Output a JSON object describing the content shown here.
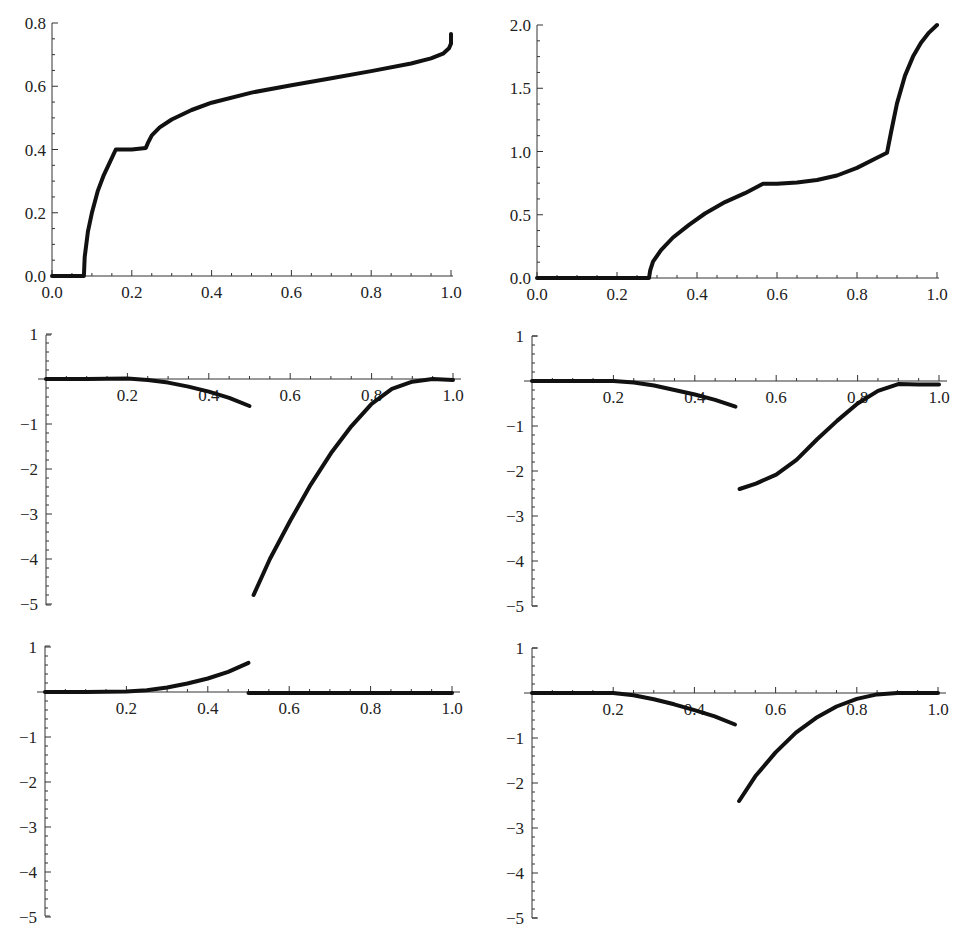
{
  "chart_data": [
    {
      "id": "panel-top-left",
      "type": "line",
      "title": "",
      "xlabel": "",
      "ylabel": "",
      "xlim": [
        0,
        1
      ],
      "ylim": [
        0,
        0.8
      ],
      "grid": false,
      "x_ticks": [
        "0.0",
        "0.2",
        "0.4",
        "0.6",
        "0.8",
        "1.0"
      ],
      "y_ticks": [
        "0.0",
        "0.2",
        "0.4",
        "0.6",
        "0.8"
      ],
      "frame": {
        "x0": 52,
        "x1": 451,
        "y0": 276,
        "ytop": 23,
        "axis_mode": "frame"
      },
      "series": [
        {
          "name": "curve",
          "points": [
            [
              0,
              0
            ],
            [
              0.08,
              0
            ],
            [
              0.082,
              0.06
            ],
            [
              0.09,
              0.14
            ],
            [
              0.1,
              0.2
            ],
            [
              0.115,
              0.27
            ],
            [
              0.13,
              0.32
            ],
            [
              0.145,
              0.36
            ],
            [
              0.16,
              0.4
            ],
            [
              0.2,
              0.4
            ],
            [
              0.235,
              0.405
            ],
            [
              0.24,
              0.42
            ],
            [
              0.25,
              0.445
            ],
            [
              0.27,
              0.47
            ],
            [
              0.3,
              0.495
            ],
            [
              0.35,
              0.525
            ],
            [
              0.4,
              0.548
            ],
            [
              0.5,
              0.58
            ],
            [
              0.6,
              0.603
            ],
            [
              0.7,
              0.625
            ],
            [
              0.8,
              0.648
            ],
            [
              0.9,
              0.672
            ],
            [
              0.95,
              0.688
            ],
            [
              0.98,
              0.703
            ],
            [
              0.995,
              0.72
            ],
            [
              1.0,
              0.735
            ],
            [
              1.0,
              0.765
            ]
          ]
        }
      ]
    },
    {
      "id": "panel-top-right",
      "type": "line",
      "title": "",
      "xlabel": "",
      "ylabel": "",
      "xlim": [
        0,
        1
      ],
      "ylim": [
        0,
        2.0
      ],
      "grid": false,
      "x_ticks": [
        "0.0",
        "0.2",
        "0.4",
        "0.6",
        "0.8",
        "1.0"
      ],
      "y_ticks": [
        "0.0",
        "0.5",
        "1.0",
        "1.5",
        "2.0"
      ],
      "frame": {
        "x0": 537,
        "x1": 937,
        "y0": 278,
        "ytop": 25,
        "axis_mode": "frame"
      },
      "series": [
        {
          "name": "curve",
          "points": [
            [
              0,
              0
            ],
            [
              0.28,
              0
            ],
            [
              0.283,
              0.06
            ],
            [
              0.29,
              0.13
            ],
            [
              0.31,
              0.22
            ],
            [
              0.34,
              0.32
            ],
            [
              0.38,
              0.42
            ],
            [
              0.42,
              0.51
            ],
            [
              0.47,
              0.6
            ],
            [
              0.52,
              0.67
            ],
            [
              0.565,
              0.745
            ],
            [
              0.6,
              0.745
            ],
            [
              0.65,
              0.755
            ],
            [
              0.7,
              0.775
            ],
            [
              0.75,
              0.81
            ],
            [
              0.8,
              0.87
            ],
            [
              0.85,
              0.95
            ],
            [
              0.875,
              0.99
            ],
            [
              0.885,
              1.15
            ],
            [
              0.9,
              1.38
            ],
            [
              0.92,
              1.6
            ],
            [
              0.94,
              1.75
            ],
            [
              0.96,
              1.86
            ],
            [
              0.98,
              1.94
            ],
            [
              1.0,
              2.0
            ]
          ]
        }
      ]
    },
    {
      "id": "panel-middle-left",
      "type": "line",
      "title": "",
      "xlabel": "",
      "ylabel": "",
      "xlim": [
        0,
        1
      ],
      "ylim": [
        -5,
        1
      ],
      "grid": false,
      "x_ticks": [
        "0.2",
        "0.4",
        "0.6",
        "0.8",
        "1.0"
      ],
      "y_ticks": [
        "1",
        "-1",
        "-2",
        "-3",
        "-4",
        "-5"
      ],
      "frame": {
        "x0": 46,
        "x1": 453,
        "y1": 335,
        "y0": 379,
        "ybot": 605,
        "axis_mode": "origin"
      },
      "series": [
        {
          "name": "segment-1",
          "points": [
            [
              0,
              0
            ],
            [
              0.1,
              0
            ],
            [
              0.2,
              0.01
            ],
            [
              0.25,
              -0.02
            ],
            [
              0.3,
              -0.08
            ],
            [
              0.35,
              -0.17
            ],
            [
              0.4,
              -0.28
            ],
            [
              0.45,
              -0.42
            ],
            [
              0.5,
              -0.6
            ]
          ]
        },
        {
          "name": "segment-2",
          "points": [
            [
              0.51,
              -4.8
            ],
            [
              0.55,
              -4.0
            ],
            [
              0.6,
              -3.15
            ],
            [
              0.65,
              -2.35
            ],
            [
              0.7,
              -1.65
            ],
            [
              0.75,
              -1.05
            ],
            [
              0.8,
              -0.55
            ],
            [
              0.85,
              -0.22
            ],
            [
              0.9,
              -0.06
            ],
            [
              0.95,
              0
            ],
            [
              1.0,
              -0.02
            ]
          ]
        }
      ]
    },
    {
      "id": "panel-middle-right",
      "type": "line",
      "title": "",
      "xlabel": "",
      "ylabel": "",
      "xlim": [
        0,
        1
      ],
      "ylim": [
        -5,
        1
      ],
      "grid": false,
      "x_ticks": [
        "0.2",
        "0.4",
        "0.6",
        "0.8",
        "1.0"
      ],
      "y_ticks": [
        "1",
        "-1",
        "-2",
        "-3",
        "-4",
        "-5"
      ],
      "frame": {
        "x0": 532,
        "x1": 939,
        "y1": 336,
        "y0": 381,
        "ybot": 606,
        "axis_mode": "origin"
      },
      "series": [
        {
          "name": "segment-1",
          "points": [
            [
              0,
              0
            ],
            [
              0.1,
              0
            ],
            [
              0.2,
              0
            ],
            [
              0.25,
              -0.03
            ],
            [
              0.3,
              -0.1
            ],
            [
              0.35,
              -0.2
            ],
            [
              0.4,
              -0.3
            ],
            [
              0.45,
              -0.42
            ],
            [
              0.5,
              -0.57
            ]
          ]
        },
        {
          "name": "segment-2",
          "points": [
            [
              0.51,
              -2.4
            ],
            [
              0.55,
              -2.28
            ],
            [
              0.6,
              -2.08
            ],
            [
              0.65,
              -1.75
            ],
            [
              0.7,
              -1.3
            ],
            [
              0.75,
              -0.88
            ],
            [
              0.8,
              -0.5
            ],
            [
              0.85,
              -0.22
            ],
            [
              0.9,
              -0.07
            ],
            [
              0.95,
              -0.08
            ],
            [
              1.0,
              -0.08
            ]
          ]
        }
      ]
    },
    {
      "id": "panel-bottom-left",
      "type": "line",
      "title": "",
      "xlabel": "",
      "ylabel": "",
      "xlim": [
        0,
        1
      ],
      "ylim": [
        -5,
        1
      ],
      "grid": false,
      "x_ticks": [
        "0.2",
        "0.4",
        "0.6",
        "0.8",
        "1.0"
      ],
      "y_ticks": [
        "1",
        "-1",
        "-2",
        "-3",
        "-4",
        "-5"
      ],
      "frame": {
        "x0": 45,
        "x1": 452,
        "y1": 646,
        "y0": 692,
        "ybot": 916,
        "axis_mode": "origin"
      },
      "series": [
        {
          "name": "segment-1",
          "points": [
            [
              0,
              0
            ],
            [
              0.1,
              0
            ],
            [
              0.2,
              0.01
            ],
            [
              0.25,
              0.04
            ],
            [
              0.3,
              0.1
            ],
            [
              0.35,
              0.19
            ],
            [
              0.4,
              0.3
            ],
            [
              0.45,
              0.45
            ],
            [
              0.5,
              0.65
            ]
          ]
        },
        {
          "name": "segment-2",
          "points": [
            [
              0.5,
              -0.02
            ],
            [
              0.6,
              -0.02
            ],
            [
              0.7,
              -0.02
            ],
            [
              0.8,
              -0.02
            ],
            [
              0.9,
              -0.02
            ],
            [
              1.0,
              -0.02
            ]
          ]
        }
      ]
    },
    {
      "id": "panel-bottom-right",
      "type": "line",
      "title": "",
      "xlabel": "",
      "ylabel": "",
      "xlim": [
        0,
        1
      ],
      "ylim": [
        -5,
        1
      ],
      "grid": false,
      "x_ticks": [
        "0.2",
        "0.4",
        "0.6",
        "0.8",
        "1.0"
      ],
      "y_ticks": [
        "1",
        "-1",
        "-2",
        "-3",
        "-4",
        "-5"
      ],
      "frame": {
        "x0": 532,
        "x1": 938,
        "y1": 648,
        "y0": 693,
        "ybot": 918,
        "axis_mode": "origin"
      },
      "series": [
        {
          "name": "segment-1",
          "points": [
            [
              0,
              0
            ],
            [
              0.1,
              0
            ],
            [
              0.2,
              0
            ],
            [
              0.25,
              -0.05
            ],
            [
              0.3,
              -0.14
            ],
            [
              0.35,
              -0.25
            ],
            [
              0.4,
              -0.38
            ],
            [
              0.45,
              -0.52
            ],
            [
              0.5,
              -0.7
            ]
          ]
        },
        {
          "name": "segment-2",
          "points": [
            [
              0.51,
              -2.4
            ],
            [
              0.55,
              -1.85
            ],
            [
              0.6,
              -1.32
            ],
            [
              0.65,
              -0.88
            ],
            [
              0.7,
              -0.55
            ],
            [
              0.75,
              -0.3
            ],
            [
              0.8,
              -0.13
            ],
            [
              0.85,
              -0.03
            ],
            [
              0.9,
              0
            ],
            [
              1.0,
              0
            ]
          ]
        }
      ]
    }
  ]
}
